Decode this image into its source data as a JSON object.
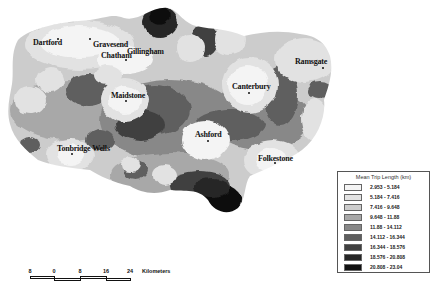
{
  "map": {
    "region": "Kent",
    "towns": [
      {
        "name": "Dartford",
        "x": 58,
        "y": 41,
        "dot": [
          57,
          38
        ]
      },
      {
        "name": "Gravesend",
        "x": 93,
        "y": 41,
        "dot": [
          90,
          38
        ]
      },
      {
        "name": "Chatham",
        "x": 102,
        "y": 52,
        "dot": [
          125,
          60
        ]
      },
      {
        "name": "Gillingham",
        "x": 128,
        "y": 47,
        "dot": [
          130,
          58
        ]
      },
      {
        "name": "Maidstone",
        "x": 111,
        "y": 92,
        "dot": [
          126,
          100
        ]
      },
      {
        "name": "Canterbury",
        "x": 232,
        "y": 83,
        "dot": [
          248,
          92
        ]
      },
      {
        "name": "Ramsgate",
        "x": 295,
        "y": 58,
        "dot": [
          322,
          67
        ]
      },
      {
        "name": "Ashford",
        "x": 196,
        "y": 131,
        "dot": [
          207,
          140
        ]
      },
      {
        "name": "Tonbridge Wells",
        "x": 58,
        "y": 145,
        "dot": [
          71,
          153
        ]
      },
      {
        "name": "Folkestone",
        "x": 258,
        "y": 154,
        "dot": [
          274,
          163
        ]
      }
    ]
  },
  "legend": {
    "title": "Mean Trip Length (km)",
    "classes": [
      {
        "label": "2.953 - 5.184",
        "color": "#f4f4f4"
      },
      {
        "label": "5.184 - 7.416",
        "color": "#e2e2e2"
      },
      {
        "label": "7.416 - 9.648",
        "color": "#cccccc"
      },
      {
        "label": "9.648 - 11.88",
        "color": "#a8a8a8"
      },
      {
        "label": "11.88 - 14.112",
        "color": "#888888"
      },
      {
        "label": "14.112 - 16.344",
        "color": "#5e5e5e"
      },
      {
        "label": "16.344 - 18.576",
        "color": "#404040"
      },
      {
        "label": "18.576 - 20.808",
        "color": "#262626"
      },
      {
        "label": "20.808 - 23.04",
        "color": "#111111"
      }
    ]
  },
  "scale_bar": {
    "ticks": [
      "8",
      "0",
      "8",
      "16",
      "24"
    ],
    "unit": "Kilometers"
  }
}
